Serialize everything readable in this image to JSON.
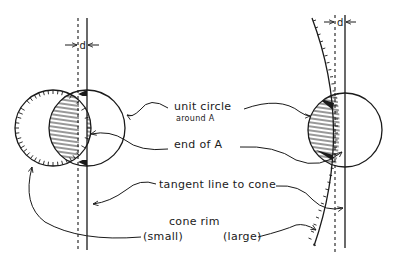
{
  "labels": {
    "d_left": "d",
    "d_right": "d",
    "unit_circle": "unit circle",
    "around_a": "around A",
    "end_of_a": "end of A",
    "tangent_line": "tangent line to cone",
    "cone_rim": "cone rim",
    "small": "(small)",
    "large": "(large)"
  },
  "figures": {
    "left": {
      "description": "Small cone rim: unit circle around A overlapping a small hatched-rim circle; lens region shaded",
      "rim_size": "small"
    },
    "right": {
      "description": "Large cone rim: unit circle around A intersecting a gently curved hatched rim; region shaded",
      "rim_size": "large"
    }
  },
  "colors": {
    "ink": "#1a1a1a",
    "paper": "#ffffff"
  }
}
